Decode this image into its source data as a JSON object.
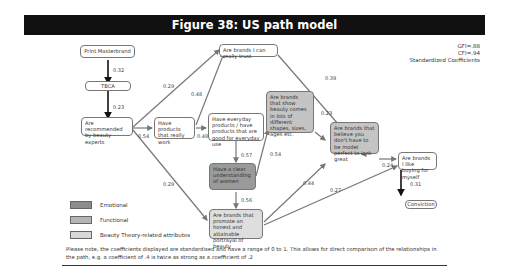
{
  "title": "Figure 38: US path model",
  "fit": {
    "gfi": "GFI=.88",
    "cfi": "CFI=.94",
    "label": "Standardized Coefficients"
  },
  "nodes": {
    "print_masterbrand": "Print Masterbrand",
    "tbca": "TBCA",
    "recommended": "Are recommended by beauty experts",
    "products_work": "Have products that really work",
    "trust": "Are brands I can really trust",
    "everyday": "Have everyday products / have products that are good for everyday use",
    "understanding": "Have a clear understanding of women",
    "beauty_shapes": "Are brands that show beauty comes in lots of different shapes, sizes, ages etc.",
    "model_perfect": "Are brands that believe you don't have to be model perfect to look great",
    "honest": "Are brands that promote an honest and attainable portrayal of beauty",
    "buying": "Are brands I like buying for myself",
    "conviction": "Conviction"
  },
  "coefficients": {
    "pm_tbca": "0.32",
    "tbca_rec": "0.23",
    "rec_trust": "0.29",
    "rec_products": "0.54",
    "rec_honest": "0.29",
    "products_trust": "0.48",
    "products_everyday": "0.48",
    "trust_buying": "0.39",
    "everyday_understanding": "0.57",
    "understanding_shapes": "0.54",
    "understanding_honest": "0.56",
    "shapes_model": "0.23",
    "model_buying": "0.24",
    "honest_model": "0.44",
    "honest_buying": "0.27",
    "buying_conviction": "0.31"
  },
  "legend": [
    {
      "label": "Emotional",
      "color": "#8c8c8c"
    },
    {
      "label": "Functional",
      "color": "#b4b4b4"
    },
    {
      "label": "Beauty Theory-related attributes",
      "color": "#d8d8d8"
    }
  ],
  "note": "Please note, the coefficients displayed are standardised and have a range of 0 to 1. This allows for direct comparison of the relationships in the path, e.g. a coefficient of .4 is twice as strong as a coefficient of .2"
}
